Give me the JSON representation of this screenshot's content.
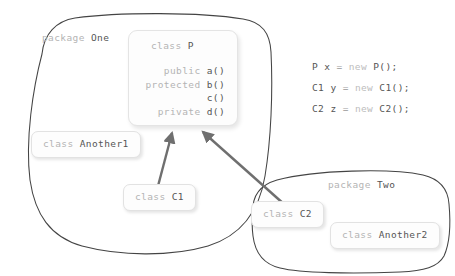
{
  "diagram": {
    "colors": {
      "blob_stroke": "#444444",
      "box_fill": "#fdfdfd",
      "box_border": "#e2e2e2",
      "arrow": "#6f6f6f",
      "keyword_gray": "#b4b4b4",
      "identifier_gray": "#555555"
    }
  },
  "packages": [
    {
      "id": "one",
      "keyword": "package",
      "name": "One"
    },
    {
      "id": "two",
      "keyword": "package",
      "name": "Two"
    }
  ],
  "class_p": {
    "keyword": "class",
    "name": "P",
    "members": [
      {
        "modifier": "public",
        "method": "a()"
      },
      {
        "modifier": "protected",
        "method": "b()"
      },
      {
        "modifier": "",
        "method": "c()"
      },
      {
        "modifier": "private",
        "method": "d()"
      }
    ]
  },
  "classes": [
    {
      "id": "another1",
      "keyword": "class",
      "name": "Another1",
      "package": "One"
    },
    {
      "id": "c1",
      "keyword": "class",
      "name": "C1",
      "package": "One"
    },
    {
      "id": "c2",
      "keyword": "class",
      "name": "C2",
      "package": "Two"
    },
    {
      "id": "another2",
      "keyword": "class",
      "name": "Another2",
      "package": "Two"
    }
  ],
  "code": {
    "lines": [
      {
        "type": "P",
        "var": "x",
        "op": "=",
        "new": "new",
        "call": "P();"
      },
      {
        "type": "C1",
        "var": "y",
        "op": "=",
        "new": "new",
        "call": "C1();"
      },
      {
        "type": "C2",
        "var": "z",
        "op": "=",
        "new": "new",
        "call": "C2();"
      }
    ]
  },
  "relations": [
    {
      "from": "C1",
      "to": "P",
      "style": "solid-arrow"
    },
    {
      "from": "C2",
      "to": "P",
      "style": "solid-arrow"
    }
  ]
}
